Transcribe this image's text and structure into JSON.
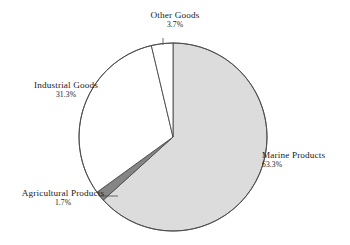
{
  "chart_data": {
    "type": "pie",
    "title": "",
    "subtitle": "",
    "xlabel": "",
    "ylabel": "",
    "legend_position": "none",
    "grid": false,
    "labels_outside": true,
    "start_angle_deg": 0,
    "direction": "clockwise",
    "categories": [
      "Marine Products",
      "Industrial Goods",
      "Other Goods",
      "Agricultural Products"
    ],
    "values": [
      63.3,
      31.3,
      3.7,
      1.7
    ],
    "unit": "%",
    "total": 100.0,
    "slices": [
      {
        "name": "Marine Products",
        "value": 63.3,
        "value_text": "63.3%",
        "fill": "#dcdcdc",
        "stroke": "#4a4a4a",
        "start_deg": 0,
        "end_deg": 227.88
      },
      {
        "name": "Agricultural Products",
        "value": 1.7,
        "value_text": "1.7%",
        "fill": "#858585",
        "stroke": "#4a4a4a",
        "start_deg": 227.88,
        "end_deg": 234.0
      },
      {
        "name": "Industrial Goods",
        "value": 31.3,
        "value_text": "31.3%",
        "fill": "#ffffff",
        "stroke": "#4a4a4a",
        "start_deg": 234.0,
        "end_deg": 346.68
      },
      {
        "name": "Other Goods",
        "value": 3.7,
        "value_text": "3.7%",
        "fill": "#ffffff",
        "stroke": "#4a4a4a",
        "start_deg": 346.68,
        "end_deg": 360.0
      }
    ]
  },
  "labels": {
    "other_goods": {
      "name": "Other Goods",
      "percent": "3.7%"
    },
    "industrial_goods": {
      "name": "Industrial Goods",
      "percent": "31.3%"
    },
    "marine_products": {
      "name": "Marine Products",
      "percent": "63.3%"
    },
    "agricultural_products": {
      "name": "Agricultural Products",
      "percent": "1.7%"
    }
  },
  "colors": {
    "marine_fill": "#dcdcdc",
    "industrial_fill": "#ffffff",
    "other_fill": "#ffffff",
    "agricultural_fill": "#858585",
    "outline": "#4a4a4a",
    "leader_line": "#4a4a4a",
    "background": "#ffffff",
    "text": "#1a1a1a"
  }
}
